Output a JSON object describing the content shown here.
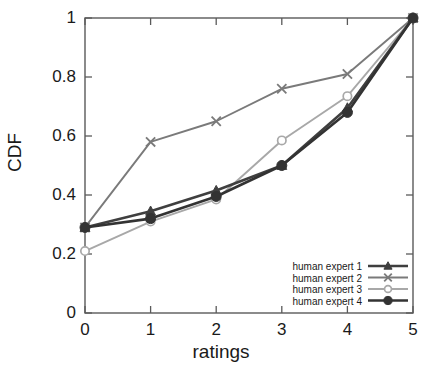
{
  "chart_data": {
    "type": "line",
    "title": "",
    "xlabel": "ratings",
    "ylabel": "CDF",
    "x": [
      0,
      1,
      2,
      3,
      4,
      5
    ],
    "xlim": [
      0,
      5
    ],
    "ylim": [
      0,
      1
    ],
    "xticks": [
      "0",
      "1",
      "2",
      "3",
      "4",
      "5"
    ],
    "yticks": [
      "0",
      "0.2",
      "0.4",
      "0.6",
      "0.8",
      "1"
    ],
    "grid": false,
    "legend_position": "lower right",
    "series": [
      {
        "name": "human expert 1",
        "marker": "filled-triangle",
        "color": "#3f3f3f",
        "values": [
          0.29,
          0.345,
          0.415,
          0.5,
          0.695,
          1.0
        ]
      },
      {
        "name": "human expert 2",
        "marker": "cross",
        "color": "#7a7a7a",
        "values": [
          0.29,
          0.58,
          0.65,
          0.76,
          0.81,
          1.0
        ]
      },
      {
        "name": "human expert 3",
        "marker": "open-circle",
        "color": "#a8a8a8",
        "values": [
          0.21,
          0.31,
          0.385,
          0.585,
          0.735,
          1.0
        ]
      },
      {
        "name": "human expert 4",
        "marker": "filled-circle",
        "color": "#333333",
        "values": [
          0.29,
          0.32,
          0.395,
          0.5,
          0.68,
          1.0
        ]
      }
    ]
  },
  "axes": {
    "ylabel": "CDF",
    "xlabel": "ratings",
    "ytick_labels": [
      "1",
      "0.8",
      "0.6",
      "0.4",
      "0.2",
      "0"
    ],
    "xtick_labels": [
      "0",
      "1",
      "2",
      "3",
      "4",
      "5"
    ]
  },
  "legend": {
    "entries": [
      {
        "label": "human expert 1"
      },
      {
        "label": "human expert 2"
      },
      {
        "label": "human expert 3"
      },
      {
        "label": "human expert 4"
      }
    ]
  },
  "style": {
    "frame_color": "#5a5a5a",
    "background": "#ffffff",
    "text_color": "#1a1a1a"
  }
}
